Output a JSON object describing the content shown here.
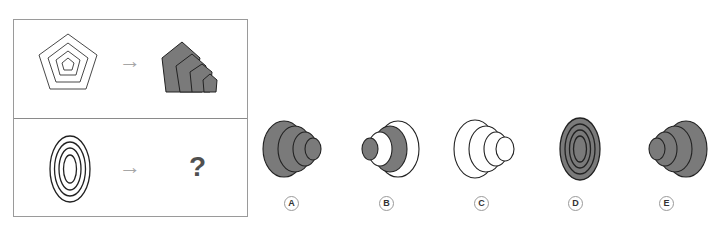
{
  "colors": {
    "fill": "#7a7a7a",
    "stroke": "#222222",
    "arrow": "#a6a6a6",
    "question": "#505050",
    "border": "#9a9a9a"
  },
  "puzzle": {
    "row1": {
      "left_shape": "concentric-pentagons-outline",
      "arrow": "→",
      "right_shape": "stacked-pentagons-filled"
    },
    "row2": {
      "left_shape": "concentric-ellipses-outline",
      "arrow": "→",
      "right_placeholder": "?"
    }
  },
  "options": [
    {
      "label": "A",
      "description": "stacked ellipses filled gray, decreasing to right"
    },
    {
      "label": "B",
      "description": "stacked ellipses alternating white and gray"
    },
    {
      "label": "C",
      "description": "stacked ellipses all white outline"
    },
    {
      "label": "D",
      "description": "concentric ellipses filled gray"
    },
    {
      "label": "E",
      "description": "stacked ellipses filled gray, decreasing to left"
    }
  ]
}
